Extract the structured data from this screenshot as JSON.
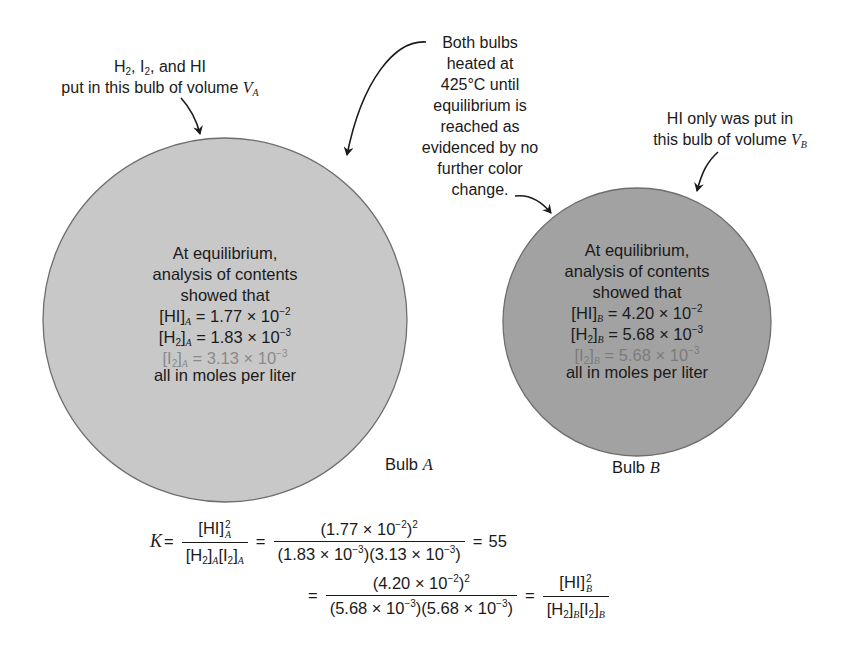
{
  "colors": {
    "bulb_a_fill": "#c8c8c8",
    "bulb_b_fill": "#a2a2a2",
    "outline": "#6e6e6e",
    "text": "#1a1a1a",
    "faint_text": "#8a8a8a"
  },
  "annotations": {
    "bulb_a_line1_parts": [
      "H",
      "2",
      ", I",
      "2",
      ", and HI"
    ],
    "bulb_a_line2": "put in this bulb of volume",
    "bulb_a_volume": "V",
    "bulb_a_volume_sub": "A",
    "heating_lines": [
      "Both bulbs",
      "heated at",
      "425°C until",
      "equilibrium is",
      "reached as",
      "evidenced by no",
      "further color",
      "change."
    ],
    "bulb_b_line1": "HI only was put in",
    "bulb_b_line2": "this bulb of volume",
    "bulb_b_volume": "V",
    "bulb_b_volume_sub": "B"
  },
  "bulb_a": {
    "label_prefix": "Bulb",
    "label_letter": "A",
    "intro": [
      "At equilibrium,",
      "analysis of contents",
      "showed that"
    ],
    "rows": [
      {
        "species": "HI",
        "species_sub": "",
        "sub": "A",
        "value": "1.77 × 10",
        "exp": "−2"
      },
      {
        "species": "H",
        "species_sub": "2",
        "sub": "A",
        "value": "1.83 × 10",
        "exp": "−3"
      },
      {
        "species": "I",
        "species_sub": "2",
        "sub": "A",
        "value": "3.13 × 10",
        "exp": "−3"
      }
    ],
    "units": "all in moles per liter"
  },
  "bulb_b": {
    "label_prefix": "Bulb",
    "label_letter": "B",
    "intro": [
      "At equilibrium,",
      "analysis of contents",
      "showed that"
    ],
    "rows": [
      {
        "species": "HI",
        "species_sub": "",
        "sub": "B",
        "value": "4.20 × 10",
        "exp": "−2"
      },
      {
        "species": "H",
        "species_sub": "2",
        "sub": "B",
        "value": "5.68 × 10",
        "exp": "−3"
      },
      {
        "species": "I",
        "species_sub": "2",
        "sub": "B",
        "value": "5.68 × 10",
        "exp": "−3"
      }
    ],
    "units": "all in moles per liter"
  },
  "equation": {
    "K": "K",
    "eq": "=",
    "line1": {
      "sym_num": "[HI]",
      "sym_num_sup": "2",
      "sym_num_sub": "A",
      "sym_den": [
        "[H",
        "2",
        "]",
        "A",
        "[I",
        "2",
        "]",
        "A"
      ],
      "num_val": "(1.77 × 10",
      "num_exp": "−2",
      "num_close": ")",
      "num_sq": "2",
      "den_val1": "(1.83 × 10",
      "den_exp1": "−3",
      "den_val2": ")(3.13 × 10",
      "den_exp2": "−3",
      "den_close": ")",
      "result": "55"
    },
    "line2": {
      "num_val": "(4.20 × 10",
      "num_exp": "−2",
      "num_close": ")",
      "num_sq": "2",
      "den_val1": "(5.68 × 10",
      "den_exp1": "−3",
      "den_val2": ")(5.68 × 10",
      "den_exp2": "−3",
      "den_close": ")",
      "sym_num": "[HI]",
      "sym_num_sup": "2",
      "sym_num_sub": "B",
      "sym_den": [
        "[H",
        "2",
        "]",
        "B",
        "[I",
        "2",
        "]",
        "B"
      ]
    }
  }
}
